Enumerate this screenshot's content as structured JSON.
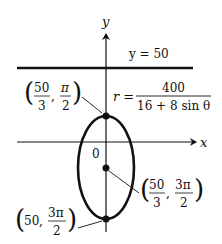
{
  "figure": {
    "axes": {
      "x_label": "x",
      "y_label": "y",
      "origin_label": "0"
    },
    "directrix": {
      "label": "y = 50"
    },
    "equation": {
      "lhs": "r =",
      "numerator": "400",
      "denominator": "16 + 8 sin θ"
    },
    "points": [
      {
        "name": "top-vertex",
        "r_num": "50",
        "r_den": "3",
        "theta_num": "π",
        "theta_den": "2"
      },
      {
        "name": "focus",
        "r_num": "50",
        "r_den": "3",
        "theta_num": "3π",
        "theta_den": "2"
      },
      {
        "name": "bottom-vertex",
        "r": "50",
        "theta_num": "3π",
        "theta_den": "2"
      }
    ],
    "comma": ",",
    "paren_open": "(",
    "paren_close": ")"
  }
}
